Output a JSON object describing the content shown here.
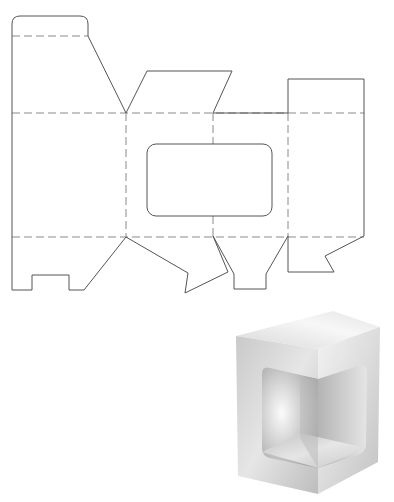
{
  "diagram": {
    "colors": {
      "cut_line": "#555555",
      "fold_line": "#8a8a8a",
      "background": "#ffffff",
      "box_light": "#f4f4f4",
      "box_mid": "#cfcfcf",
      "box_dark": "#a9a9a9"
    },
    "dieline": {
      "cut_paths": [
        {
          "name": "outer-left-top-tab",
          "d": "M12,290 L12,24 Q12,16 20,16 L80,16 Q88,16 88,24 L88,36 L126,113"
        },
        {
          "name": "top-flap-center",
          "d": "M126,113 L147,71 L232,71 L213,113"
        },
        {
          "name": "top-edge-right",
          "d": "M213,113 L288,113 L288,79 L364,79 L364,236"
        },
        {
          "name": "bottom-right-flap",
          "d": "M364,236 L325,256 L334,272 L288,272 L288,236"
        },
        {
          "name": "bottom-center-flap",
          "d": "M288,236 L266,274 L266,289 L234,289 L234,274 L213,236"
        },
        {
          "name": "bottom-left-flap",
          "d": "M213,236 L228,272 L185,293 L188,273 L126,237"
        },
        {
          "name": "bottom-left-tab",
          "d": "M126,237 L84,290 L69,290 L69,275 L32,275 L32,290 L12,290"
        }
      ],
      "fold_paths": [
        {
          "name": "fold-top-tab",
          "d": "M12,36 L88,36"
        },
        {
          "name": "fold-horizontal-top",
          "d": "M12,113 L364,113"
        },
        {
          "name": "fold-horizontal-bottom",
          "d": "M12,237 L364,237"
        },
        {
          "name": "fold-vertical-1",
          "d": "M126,113 L126,237"
        },
        {
          "name": "fold-vertical-2",
          "d": "M213,113 L213,144"
        },
        {
          "name": "fold-vertical-2b",
          "d": "M213,216 L213,237"
        },
        {
          "name": "fold-vertical-3",
          "d": "M288,113 L288,237"
        }
      ],
      "window": {
        "x": 147,
        "y": 144,
        "width": 125,
        "height": 72,
        "rx": 9
      }
    },
    "box_render": {
      "top_face": "333,311 236,336 318,349 380,327",
      "left_face": "236,336 318,349 318,494 238,476",
      "right_face": "318,349 380,327 378,462 318,494",
      "window_left": "M262,374 Q262,366 270,368 L318,379 L318,468 L270,458 Q262,456 262,448 Z",
      "window_right": "M318,379 L358,366 Q367,363 367,372 L366,444 Q366,452 358,455 L318,468 Z",
      "inner_back_left": "262,368 300,378 300,438 262,452",
      "inner_back_right": "300,378 318,379 318,468 300,438",
      "inner_floor": "262,452 300,433 366,448 318,468"
    }
  }
}
